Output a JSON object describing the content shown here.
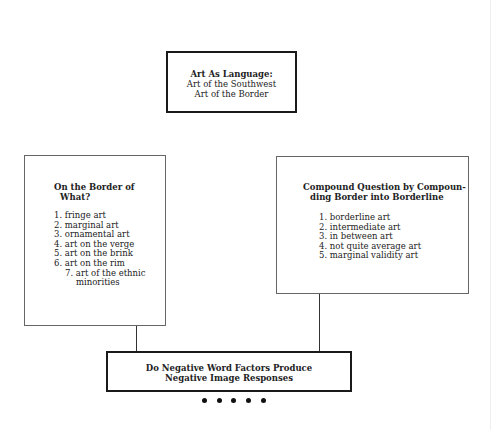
{
  "diagram": {
    "top_box": {
      "title": "Art As Language:",
      "lines": [
        "Art of the Southwest",
        "Art of the Border"
      ]
    },
    "left_box": {
      "title_line1": "On the Border of",
      "title_line2": "What?",
      "items": [
        "1. fringe art",
        "2. marginal art",
        "3. ornamental art",
        "4. art on the verge",
        "5. art on the brink",
        "6. art on the rim",
        "7. art of the ethnic minorities"
      ]
    },
    "right_box": {
      "title_line1": "Compound Question by Compoun-",
      "title_line2": "ding Border into Borderline",
      "items": [
        "1. borderline art",
        "2. intermediate art",
        "3. in between art",
        "4. not quite average art",
        "5. marginal validity art"
      ]
    },
    "bottom_box": {
      "line1": "Do Negative Word Factors Produce",
      "line2": "Negative Image Responses"
    },
    "dots_count": 5
  }
}
